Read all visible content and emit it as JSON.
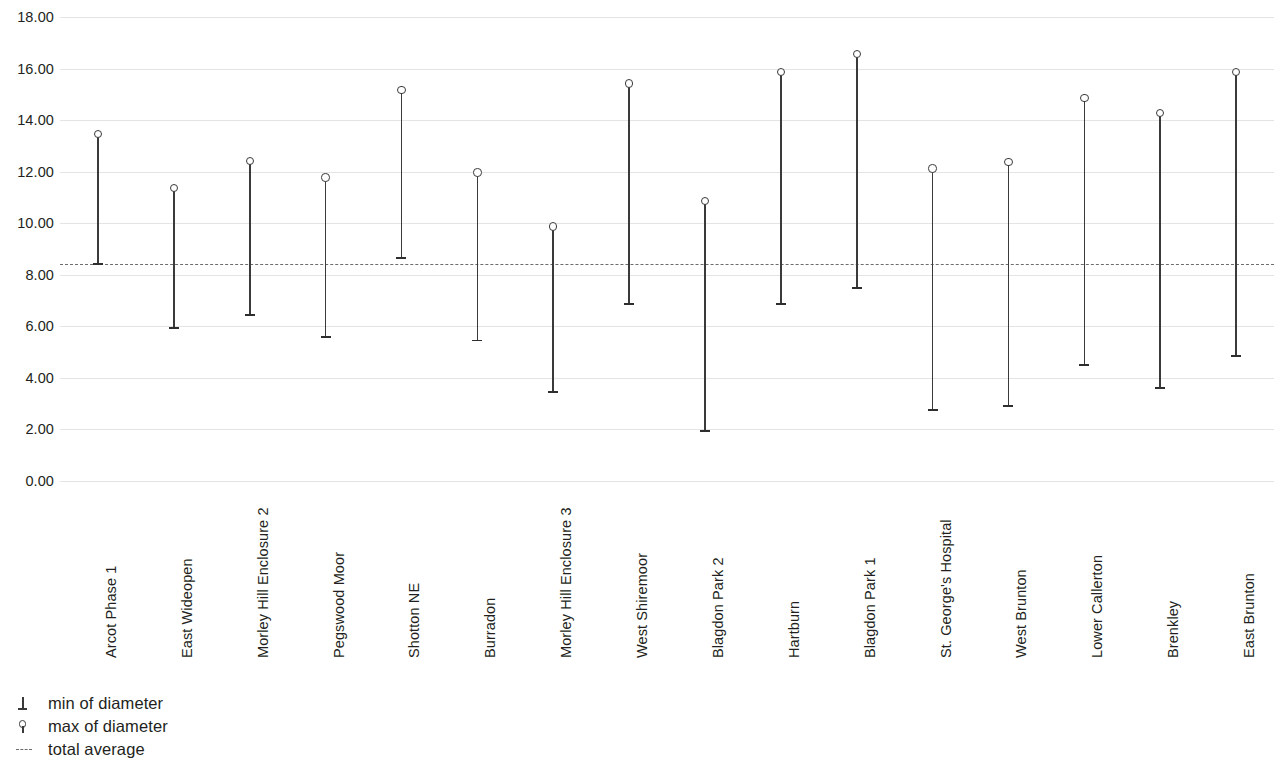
{
  "chart_data": {
    "type": "bar",
    "title": "",
    "subtitle": "",
    "xlabel": "",
    "ylabel": "",
    "ylim": [
      0,
      18
    ],
    "ytick_step": 2,
    "ytick_labels": [
      "18.00",
      "16.00",
      "14.00",
      "12.00",
      "10.00",
      "8.00",
      "6.00",
      "4.00",
      "2.00",
      "0.00"
    ],
    "ytick_values": [
      18,
      16,
      14,
      12,
      10,
      8,
      6,
      4,
      2,
      0
    ],
    "grid": true,
    "legend_position": "bottom-left",
    "categories": [
      "Arcot Phase 1",
      "East Wideopen",
      "Morley Hill Enclosure 2",
      "Pegswood Moor",
      "Shotton NE",
      "Burradon",
      "Morley Hill Enclosure 3",
      "West Shiremoor",
      "Blagdon Park 2",
      "Hartburn",
      "Blagdon Park 1",
      "St. George's Hospital",
      "West Brunton",
      "Lower Callerton",
      "Brenkley",
      "East Brunton"
    ],
    "series": [
      {
        "name": "min of diameter",
        "values": [
          8.4,
          5.95,
          6.45,
          5.6,
          8.65,
          5.45,
          3.45,
          6.85,
          1.95,
          6.85,
          7.5,
          2.75,
          2.9,
          4.5,
          3.6,
          4.85
        ]
      },
      {
        "name": "max of diameter",
        "values": [
          13.45,
          11.35,
          12.4,
          11.75,
          15.15,
          11.95,
          9.85,
          15.4,
          10.85,
          15.85,
          16.55,
          12.1,
          12.35,
          14.85,
          14.25,
          15.85
        ]
      }
    ],
    "reference_line": {
      "name": "total average",
      "value": 8.4
    },
    "legend": [
      {
        "label": "min of diameter",
        "marker": "min-cap-icon"
      },
      {
        "label": "max of diameter",
        "marker": "max-circle-icon"
      },
      {
        "label": "total average",
        "marker": "dashed-line-icon"
      }
    ],
    "colors": {
      "stem": "#3a3a3a",
      "gridline": "#e4e4e4",
      "average_line": "#6d6d6d",
      "text": "#231f20",
      "background": "#ffffff"
    }
  }
}
